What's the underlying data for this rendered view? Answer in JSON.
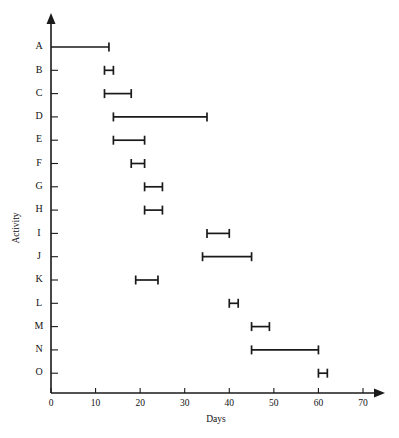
{
  "chart_data": {
    "type": "bar",
    "title": "",
    "subtitle": "",
    "xlabel": "Days",
    "ylabel": "Activity",
    "orientation": "horizontal",
    "grid": false,
    "legend": null,
    "xlim": [
      0,
      70
    ],
    "xticks": [
      0,
      10,
      20,
      30,
      40,
      50,
      60,
      70
    ],
    "xtick_labels": [
      "0",
      "10",
      "20",
      "30",
      "40",
      "50",
      "60",
      "70"
    ],
    "categories": [
      "A",
      "B",
      "C",
      "D",
      "E",
      "F",
      "G",
      "H",
      "I",
      "J",
      "K",
      "L",
      "M",
      "N",
      "O"
    ],
    "bars": [
      {
        "activity": "A",
        "start": 0,
        "end": 13,
        "duration": 13
      },
      {
        "activity": "B",
        "start": 12,
        "end": 14,
        "duration": 2
      },
      {
        "activity": "C",
        "start": 12,
        "end": 18,
        "duration": 6
      },
      {
        "activity": "D",
        "start": 14,
        "end": 35,
        "duration": 21
      },
      {
        "activity": "E",
        "start": 14,
        "end": 21,
        "duration": 7
      },
      {
        "activity": "F",
        "start": 18,
        "end": 21,
        "duration": 3
      },
      {
        "activity": "G",
        "start": 21,
        "end": 25,
        "duration": 4
      },
      {
        "activity": "H",
        "start": 21,
        "end": 25,
        "duration": 4
      },
      {
        "activity": "I",
        "start": 35,
        "end": 40,
        "duration": 5
      },
      {
        "activity": "J",
        "start": 34,
        "end": 45,
        "duration": 11
      },
      {
        "activity": "K",
        "start": 19,
        "end": 24,
        "duration": 5
      },
      {
        "activity": "L",
        "start": 40,
        "end": 42,
        "duration": 2
      },
      {
        "activity": "M",
        "start": 45,
        "end": 49,
        "duration": 4
      },
      {
        "activity": "N",
        "start": 45,
        "end": 60,
        "duration": 15
      },
      {
        "activity": "O",
        "start": 60,
        "end": 62,
        "duration": 2
      }
    ],
    "colors": {
      "bar": "#1a1a1a",
      "axis": "#1a1a1a",
      "background": "#ffffff",
      "text": "#111111"
    }
  },
  "axes": {
    "x_title": "Days",
    "y_title": "Activity"
  }
}
